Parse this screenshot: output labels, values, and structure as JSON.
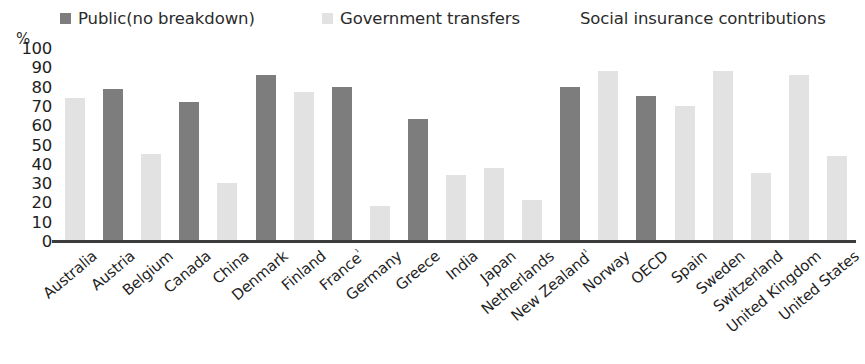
{
  "chart_data": {
    "type": "bar",
    "title": "",
    "subtitle": "",
    "xlabel": "",
    "ylabel": "%",
    "ylim": [
      0,
      100
    ],
    "yticks": [
      "100",
      "90",
      "80",
      "70",
      "60",
      "50",
      "40",
      "30",
      "20",
      "10",
      "0"
    ],
    "grid": false,
    "legend_position": "top",
    "legend": [
      {
        "label": "Public(no breakdown)",
        "color": "#7d7d7d",
        "key": "public"
      },
      {
        "label": "Government transfers",
        "color": "#e2e2e2",
        "key": "transfers"
      },
      {
        "label": "Social insurance contributions",
        "color": "#e2e2e2",
        "key": "social"
      }
    ],
    "categories": [
      "Australia",
      "Austria",
      "Belgium",
      "Canada",
      "China",
      "Denmark",
      "Finland",
      "France¹",
      "Germany",
      "Greece",
      "India",
      "Japan",
      "Netherlands",
      "New Zealand¹",
      "Norway",
      "OECD",
      "Spain",
      "Sweden",
      "Switzerland",
      "United Kingdom",
      "United States"
    ],
    "bars": [
      {
        "category": "Australia",
        "value": 74,
        "series": "transfers"
      },
      {
        "category": "Austria",
        "value": 79,
        "series": "public"
      },
      {
        "category": "Belgium",
        "value": 45,
        "series": "transfers"
      },
      {
        "category": "Canada",
        "value": 72,
        "series": "public"
      },
      {
        "category": "China",
        "value": 30,
        "series": "transfers"
      },
      {
        "category": "Denmark",
        "value": 86,
        "series": "public"
      },
      {
        "category": "Finland",
        "value": 77,
        "series": "transfers"
      },
      {
        "category": "France¹",
        "value": 80,
        "series": "public"
      },
      {
        "category": "Germany",
        "value": 18,
        "series": "transfers"
      },
      {
        "category": "Greece",
        "value": 63,
        "series": "public"
      },
      {
        "category": "India",
        "value": 34,
        "series": "transfers"
      },
      {
        "category": "Japan",
        "value": 38,
        "series": "transfers"
      },
      {
        "category": "Netherlands",
        "value": 21,
        "series": "transfers"
      },
      {
        "category": "New Zealand¹",
        "value": 80,
        "series": "public"
      },
      {
        "category": "Norway",
        "value": 88,
        "series": "transfers"
      },
      {
        "category": "OECD",
        "value": 75,
        "series": "public"
      },
      {
        "category": "Spain",
        "value": 70,
        "series": "transfers"
      },
      {
        "category": "Sweden",
        "value": 88,
        "series": "transfers"
      },
      {
        "category": "Switzerland",
        "value": 35,
        "series": "transfers"
      },
      {
        "category": "United Kingdom",
        "value": 86,
        "series": "transfers"
      },
      {
        "category": "United States",
        "value": 44,
        "series": "transfers"
      }
    ]
  },
  "axis": {
    "percent_sign": "%"
  },
  "colors": {
    "dark": "#7d7d7d",
    "light": "#e2e2e2",
    "baseline": "#3c3c3c",
    "text": "#1f1f1f"
  }
}
